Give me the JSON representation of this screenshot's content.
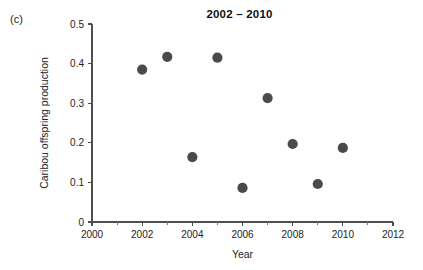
{
  "panel": {
    "label": "(c)"
  },
  "chart_data": {
    "type": "scatter",
    "title": "2002 – 2010",
    "xlabel": "Year",
    "ylabel": "Caribou offspring production",
    "xlim": [
      2000,
      2012
    ],
    "ylim": [
      0,
      0.5
    ],
    "grid": false,
    "legend": null,
    "marker_color": "#4a4a4a",
    "axis_color": "#4f4f4f",
    "xticks": [
      2000,
      2002,
      2004,
      2006,
      2008,
      2010,
      2012
    ],
    "xticklabels": [
      "2000",
      "2002",
      "2004",
      "2006",
      "2008",
      "2010",
      "2012"
    ],
    "xticks_minor": [
      2001,
      2003,
      2005,
      2007,
      2009,
      2011
    ],
    "yticks": [
      0,
      0.1,
      0.2,
      0.3,
      0.4,
      0.5
    ],
    "yticklabels": [
      "0",
      "0.1",
      "0.2",
      "0.3",
      "0.4",
      "0.5"
    ],
    "x": [
      2002,
      2003,
      2004,
      2005,
      2006,
      2007,
      2008,
      2009,
      2010
    ],
    "y": [
      0.385,
      0.417,
      0.164,
      0.415,
      0.086,
      0.313,
      0.197,
      0.096,
      0.187
    ],
    "points": [
      {
        "year": 2002,
        "value": 0.385
      },
      {
        "year": 2003,
        "value": 0.417
      },
      {
        "year": 2004,
        "value": 0.164
      },
      {
        "year": 2005,
        "value": 0.415
      },
      {
        "year": 2006,
        "value": 0.086
      },
      {
        "year": 2007,
        "value": 0.313
      },
      {
        "year": 2008,
        "value": 0.197
      },
      {
        "year": 2009,
        "value": 0.096
      },
      {
        "year": 2010,
        "value": 0.187
      }
    ]
  }
}
